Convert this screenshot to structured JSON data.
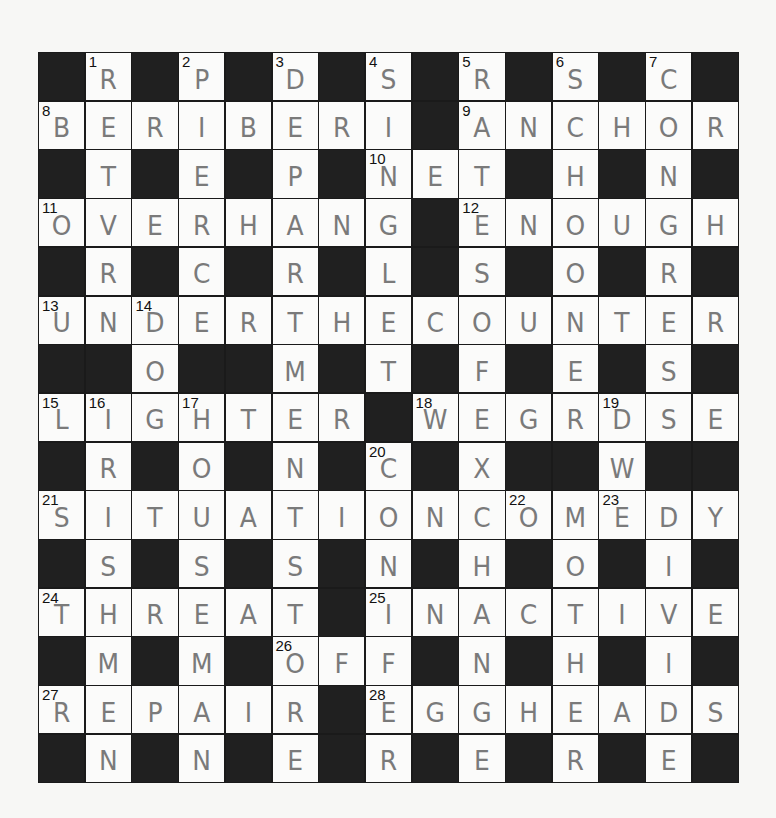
{
  "puzzle": {
    "size": {
      "rows": 15,
      "cols": 15
    },
    "colors": {
      "black_square": "#202020",
      "white_square": "#fbfbfa",
      "letter": "#7a7a7a",
      "number": "#111111",
      "background": "#f7f7f5"
    },
    "grid": [
      "#R#P#D#S#R#S#C#",
      "BERIBERI#ANCHOR",
      "#T#E#P#NET#H#N#",
      "OVERHANG#ENOUGH",
      "#R#C#R#L#S#O#R#",
      "UNDERTHECOUNTER",
      "##O##M#T#F#E#S#",
      "LIGHTER#WEGRDSE",
      "#R#O#N#C#X##W##",
      "SITUATIONCOMEDY",
      "#S#S#S#N#H#O#I#",
      "THREAT#INACTIVE",
      "#M#M#OFF#N#H#I#",
      "REPAIR#EGGHEADS",
      "#N#N#E#R#E#R#E#"
    ],
    "numbers": [
      {
        "row": 0,
        "col": 1,
        "n": "1"
      },
      {
        "row": 0,
        "col": 3,
        "n": "2"
      },
      {
        "row": 0,
        "col": 5,
        "n": "3"
      },
      {
        "row": 0,
        "col": 7,
        "n": "4"
      },
      {
        "row": 0,
        "col": 9,
        "n": "5"
      },
      {
        "row": 0,
        "col": 11,
        "n": "6"
      },
      {
        "row": 0,
        "col": 13,
        "n": "7"
      },
      {
        "row": 1,
        "col": 0,
        "n": "8"
      },
      {
        "row": 1,
        "col": 9,
        "n": "9"
      },
      {
        "row": 2,
        "col": 7,
        "n": "10"
      },
      {
        "row": 3,
        "col": 0,
        "n": "11"
      },
      {
        "row": 3,
        "col": 9,
        "n": "12"
      },
      {
        "row": 5,
        "col": 0,
        "n": "13"
      },
      {
        "row": 5,
        "col": 2,
        "n": "14"
      },
      {
        "row": 7,
        "col": 0,
        "n": "15"
      },
      {
        "row": 7,
        "col": 1,
        "n": "16"
      },
      {
        "row": 7,
        "col": 3,
        "n": "17"
      },
      {
        "row": 7,
        "col": 8,
        "n": "18"
      },
      {
        "row": 7,
        "col": 12,
        "n": "19"
      },
      {
        "row": 8,
        "col": 7,
        "n": "20"
      },
      {
        "row": 9,
        "col": 0,
        "n": "21"
      },
      {
        "row": 9,
        "col": 10,
        "n": "22"
      },
      {
        "row": 9,
        "col": 12,
        "n": "23"
      },
      {
        "row": 11,
        "col": 0,
        "n": "24"
      },
      {
        "row": 11,
        "col": 7,
        "n": "25"
      },
      {
        "row": 12,
        "col": 5,
        "n": "26"
      },
      {
        "row": 13,
        "col": 0,
        "n": "27"
      },
      {
        "row": 13,
        "col": 7,
        "n": "28"
      }
    ],
    "across_entries": [
      {
        "n": "8",
        "answer": "BERIBERI"
      },
      {
        "n": "9",
        "answer": "ANCHOR"
      },
      {
        "n": "10",
        "answer": "NET"
      },
      {
        "n": "11",
        "answer": "OVERHANG"
      },
      {
        "n": "12",
        "answer": "ENOUGH"
      },
      {
        "n": "13",
        "answer": "UNDERTHECOUNTER"
      },
      {
        "n": "15",
        "answer": "LIGHTER"
      },
      {
        "n": "18",
        "answer": "WEGRDSE"
      },
      {
        "n": "21",
        "answer": "SITUATIONCOMEDY"
      },
      {
        "n": "24",
        "answer": "THREAT"
      },
      {
        "n": "25",
        "answer": "INACTIVE"
      },
      {
        "n": "26",
        "answer": "OFF"
      },
      {
        "n": "27",
        "answer": "REPAIR"
      },
      {
        "n": "28",
        "answer": "EGGHEADS"
      }
    ]
  }
}
